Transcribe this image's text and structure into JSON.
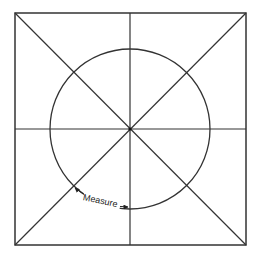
{
  "diagram": {
    "type": "geometric-figure",
    "square": {
      "x1": 15,
      "y1": 13,
      "x2": 246,
      "y2": 245
    },
    "circle": {
      "cx": 130,
      "cy": 129,
      "r": 80
    },
    "annotation": {
      "label": "Measure",
      "arc_from": {
        "x": 73,
        "y": 186
      },
      "arc_to": {
        "x": 130,
        "y": 209
      }
    },
    "stroke_color": "#333333",
    "background": "#ffffff"
  }
}
